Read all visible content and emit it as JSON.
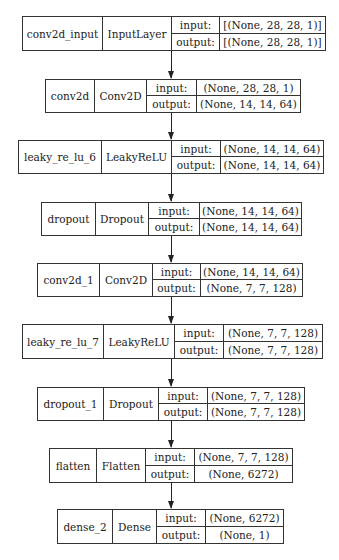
{
  "diagram": {
    "type": "keras_model_plot",
    "labels": {
      "input": "input:",
      "output": "output:"
    },
    "layers": [
      {
        "name": "conv2d_input",
        "class": "InputLayer",
        "input": "[(None, 28, 28, 1)]",
        "output": "[(None, 28, 28, 1)]"
      },
      {
        "name": "conv2d",
        "class": "Conv2D",
        "input": "(None, 28, 28, 1)",
        "output": "(None, 14, 14, 64)"
      },
      {
        "name": "leaky_re_lu_6",
        "class": "LeakyReLU",
        "input": "(None, 14, 14, 64)",
        "output": "(None, 14, 14, 64)"
      },
      {
        "name": "dropout",
        "class": "Dropout",
        "input": "(None, 14, 14, 64)",
        "output": "(None, 14, 14, 64)"
      },
      {
        "name": "conv2d_1",
        "class": "Conv2D",
        "input": "(None, 14, 14, 64)",
        "output": "(None, 7, 7, 128)"
      },
      {
        "name": "leaky_re_lu_7",
        "class": "LeakyReLU",
        "input": "(None, 7, 7, 128)",
        "output": "(None, 7, 7, 128)"
      },
      {
        "name": "dropout_1",
        "class": "Dropout",
        "input": "(None, 7, 7, 128)",
        "output": "(None, 7, 7, 128)"
      },
      {
        "name": "flatten",
        "class": "Flatten",
        "input": "(None, 7, 7, 128)",
        "output": "(None, 6272)"
      },
      {
        "name": "dense_2",
        "class": "Dense",
        "input": "(None, 6272)",
        "output": "(None, 1)"
      }
    ],
    "edges": [
      [
        "conv2d_input",
        "conv2d"
      ],
      [
        "conv2d",
        "leaky_re_lu_6"
      ],
      [
        "leaky_re_lu_6",
        "dropout"
      ],
      [
        "dropout",
        "conv2d_1"
      ],
      [
        "conv2d_1",
        "leaky_re_lu_7"
      ],
      [
        "leaky_re_lu_7",
        "dropout_1"
      ],
      [
        "dropout_1",
        "flatten"
      ],
      [
        "flatten",
        "dense_2"
      ]
    ]
  }
}
